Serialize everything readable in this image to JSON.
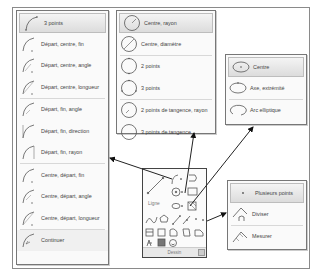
{
  "arc_menu": {
    "items": [
      {
        "label": "3 points",
        "icon": "arc-3points-icon",
        "highlighted": true
      },
      {
        "label": "Départ, centre, fin",
        "icon": "arc-start-center-end-icon"
      },
      {
        "label": "Départ, centre, angle",
        "icon": "arc-start-center-angle-icon"
      },
      {
        "label": "Départ, centre, longueur",
        "icon": "arc-start-center-length-icon"
      },
      {
        "label": "Départ, fin, angle",
        "icon": "arc-start-end-angle-icon"
      },
      {
        "label": "Départ, fin, direction",
        "icon": "arc-start-end-direction-icon"
      },
      {
        "label": "Départ, fin, rayon",
        "icon": "arc-start-end-radius-icon"
      },
      {
        "label": "Centre, départ, fin",
        "icon": "arc-center-start-end-icon"
      },
      {
        "label": "Centre, départ, angle",
        "icon": "arc-center-start-angle-icon"
      },
      {
        "label": "Centre, départ, longueur",
        "icon": "arc-center-start-length-icon"
      },
      {
        "label": "Continuer",
        "icon": "arc-continue-icon"
      }
    ]
  },
  "circle_menu": {
    "items": [
      {
        "label": "Centre, rayon",
        "icon": "circle-center-radius-icon",
        "highlighted": true
      },
      {
        "label": "Centre, diamètre",
        "icon": "circle-center-diameter-icon"
      },
      {
        "label": "2 points",
        "icon": "circle-2points-icon"
      },
      {
        "label": "3 points",
        "icon": "circle-3points-icon"
      },
      {
        "label": "2 points de tangence, rayon",
        "icon": "circle-ttr-icon"
      },
      {
        "label": "3 points de tangence",
        "icon": "circle-ttt-icon"
      }
    ]
  },
  "ellipse_menu": {
    "items": [
      {
        "label": "Centre",
        "icon": "ellipse-center-icon",
        "highlighted": true
      },
      {
        "label": "Axe, extrémité",
        "icon": "ellipse-axis-end-icon"
      },
      {
        "label": "Arc elliptique",
        "icon": "ellipse-arc-icon"
      }
    ]
  },
  "point_menu": {
    "items": [
      {
        "label": "Plusieurs points",
        "icon": "multiple-points-icon",
        "highlighted": true
      },
      {
        "label": "Diviser",
        "icon": "divide-icon"
      },
      {
        "label": "Mesurer",
        "icon": "measure-icon"
      }
    ]
  },
  "draw_panel": {
    "title": "Dessin",
    "line_label": "Ligne"
  }
}
